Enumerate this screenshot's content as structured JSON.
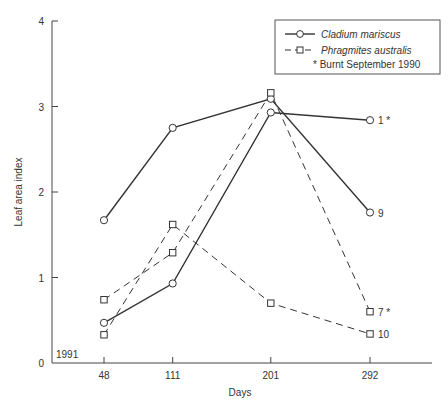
{
  "chart_data": {
    "type": "line",
    "title": "",
    "xlabel": "Days",
    "ylabel": "Leaf area index",
    "x": [
      48,
      111,
      201,
      292
    ],
    "x_tick_labels": [
      "48",
      "111",
      "201",
      "292"
    ],
    "y_ticks": [
      0,
      1,
      2,
      3,
      4
    ],
    "y_tick_labels": [
      "0",
      "1",
      "2",
      "3",
      "4"
    ],
    "ylim": [
      0,
      4
    ],
    "grid": false,
    "corner_annotation": "1991",
    "legend": {
      "placement": "top-right",
      "entries": [
        {
          "label": "Cladium mariscus",
          "style": "solid",
          "marker": "circle"
        },
        {
          "label": "Phragmites australis",
          "style": "dashed",
          "marker": "square"
        }
      ],
      "note": "* Burnt September 1990"
    },
    "series": [
      {
        "name": "Cladium mariscus",
        "site": "1 *",
        "end_label": "1 *",
        "style": "solid",
        "marker": "circle",
        "values": [
          0.47,
          0.93,
          2.93,
          2.84
        ]
      },
      {
        "name": "Cladium mariscus",
        "site": "9",
        "end_label": "9",
        "style": "solid",
        "marker": "circle",
        "values": [
          1.67,
          2.75,
          3.09,
          1.76
        ]
      },
      {
        "name": "Phragmites australis",
        "site": "7 *",
        "end_label": "7 *",
        "style": "dashed",
        "marker": "square",
        "values": [
          0.74,
          1.29,
          3.16,
          0.6
        ]
      },
      {
        "name": "Phragmites australis",
        "site": "10",
        "end_label": "10",
        "style": "dashed",
        "marker": "square",
        "values": [
          0.33,
          1.62,
          0.7,
          0.34
        ]
      }
    ]
  }
}
